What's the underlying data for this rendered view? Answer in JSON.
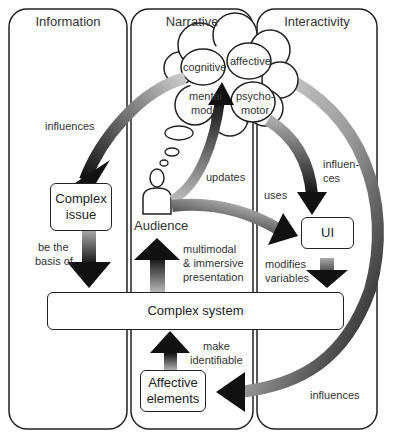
{
  "columns": [
    {
      "title": "Information"
    },
    {
      "title": "Narrative"
    },
    {
      "title": "Interactivity"
    }
  ],
  "cloud": {
    "cognitive": "cognitive",
    "affective": "affective",
    "psychomotor_1": "psycho-",
    "psychomotor_2": "motor",
    "mental_1": "mental",
    "mental_2": "model"
  },
  "nodes": {
    "complex_issue_1": "Complex",
    "complex_issue_2": "issue",
    "audience": "Audience",
    "ui": "UI",
    "complex_system": "Complex system",
    "affective_elements_1": "Affective",
    "affective_elements_2": "elements"
  },
  "edges": {
    "influences_left": "influences",
    "updates": "updates",
    "uses": "uses",
    "influences_ui_1": "influen-",
    "influences_ui_2": "ces",
    "basis_1": "be the",
    "basis_2": "basis of",
    "multimodal_1": "multimodal",
    "multimodal_2": "& immersive",
    "multimodal_3": "presentation",
    "modifies_1": "modifies",
    "modifies_2": "variables",
    "make_1": "make",
    "make_2": "identifiable",
    "influences_right": "influences"
  }
}
